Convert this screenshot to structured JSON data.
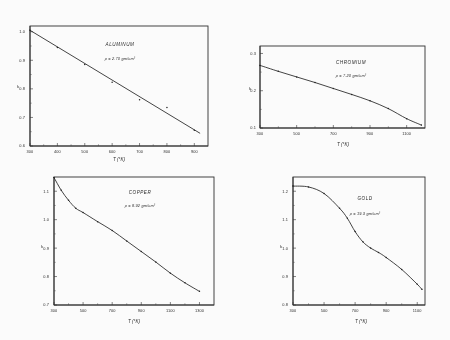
{
  "figure": {
    "caption_present": false,
    "panel_count": 4,
    "background_color": "#fefefe",
    "ink_color": "#1c1c1c"
  },
  "chart_data": [
    {
      "type": "line",
      "title": "ALUMINUM",
      "annotation": "ρ = 2.70 gm/cm³",
      "xlabel": "T (°K)",
      "ylabel": "k",
      "xlim": [
        300,
        950
      ],
      "ylim": [
        0.6,
        1.02
      ],
      "xticks": [
        300,
        400,
        500,
        600,
        700,
        800,
        900
      ],
      "xtick_labels": [
        "300",
        "400",
        "500",
        "600",
        "700",
        "800",
        "900"
      ],
      "yticks": [
        0.6,
        0.7,
        0.8,
        0.9,
        1.0
      ],
      "ytick_labels": [
        "0.6",
        "0.7",
        "0.8",
        "0.9",
        "1.0"
      ],
      "grid": false,
      "legend": false,
      "x": [
        300,
        400,
        500,
        600,
        700,
        800,
        900
      ],
      "values": [
        1.005,
        0.945,
        0.885,
        0.823,
        0.762,
        0.735,
        0.655
      ],
      "markers": true,
      "fit_line": {
        "x": [
          300,
          920
        ],
        "y": [
          1.005,
          0.645
        ]
      }
    },
    {
      "type": "line",
      "title": "CHROMIUM",
      "annotation": "ρ = 7.20 gm/cm³",
      "xlabel": "T (°K)",
      "ylabel": "k",
      "xlim": [
        300,
        1200
      ],
      "ylim": [
        0.1,
        0.32
      ],
      "xticks": [
        300,
        500,
        700,
        900,
        1100
      ],
      "xtick_labels": [
        "300",
        "500",
        "700",
        "900",
        "1100"
      ],
      "yticks": [
        0.1,
        0.2,
        0.3
      ],
      "ytick_labels": [
        "0.1",
        "0.2",
        "0.3"
      ],
      "grid": false,
      "legend": false,
      "x": [
        300,
        400,
        500,
        600,
        700,
        800,
        900,
        1000,
        1100,
        1180
      ],
      "values": [
        0.268,
        0.252,
        0.237,
        0.222,
        0.206,
        0.19,
        0.173,
        0.152,
        0.125,
        0.108
      ],
      "markers": true
    },
    {
      "type": "line",
      "title": "COPPER",
      "annotation": "ρ = 8.92 gm/cm³",
      "xlabel": "T (°K)",
      "ylabel": "k",
      "xlim": [
        300,
        1400
      ],
      "ylim": [
        0.7,
        1.15
      ],
      "xticks": [
        300,
        500,
        700,
        900,
        1100,
        1300
      ],
      "xtick_labels": [
        "300",
        "500",
        "700",
        "900",
        "1100",
        "1300"
      ],
      "yticks": [
        0.7,
        0.8,
        0.9,
        1.0,
        1.1
      ],
      "ytick_labels": [
        "0.7",
        "0.8",
        "0.9",
        "1.0",
        "1.1"
      ],
      "grid": false,
      "legend": false,
      "x": [
        300,
        350,
        400,
        450,
        500,
        600,
        700,
        800,
        900,
        1000,
        1100,
        1200,
        1300
      ],
      "values": [
        1.148,
        1.103,
        1.068,
        1.04,
        1.025,
        0.993,
        0.962,
        0.925,
        0.888,
        0.851,
        0.812,
        0.778,
        0.748
      ],
      "markers": true
    },
    {
      "type": "line",
      "title": "GOLD",
      "annotation": "ρ = 19.3 gm/cm³",
      "xlabel": "T (°K)",
      "ylabel": "k",
      "xlim": [
        300,
        1150
      ],
      "ylim": [
        0.8,
        1.25
      ],
      "xticks": [
        300,
        500,
        700,
        900,
        1100
      ],
      "xtick_labels": [
        "300",
        "500",
        "700",
        "900",
        "1100"
      ],
      "yticks": [
        0.8,
        0.9,
        1.0,
        1.1,
        1.2
      ],
      "ytick_labels": [
        "0.8",
        "0.9",
        "1.0",
        "1.1",
        "1.2"
      ],
      "grid": false,
      "legend": false,
      "x": [
        300,
        400,
        500,
        600,
        650,
        700,
        750,
        800,
        850,
        900,
        1000,
        1100,
        1130
      ],
      "values": [
        1.218,
        1.215,
        1.192,
        1.14,
        1.105,
        1.058,
        1.022,
        1.0,
        0.985,
        0.967,
        0.925,
        0.873,
        0.855
      ],
      "markers": true
    }
  ]
}
